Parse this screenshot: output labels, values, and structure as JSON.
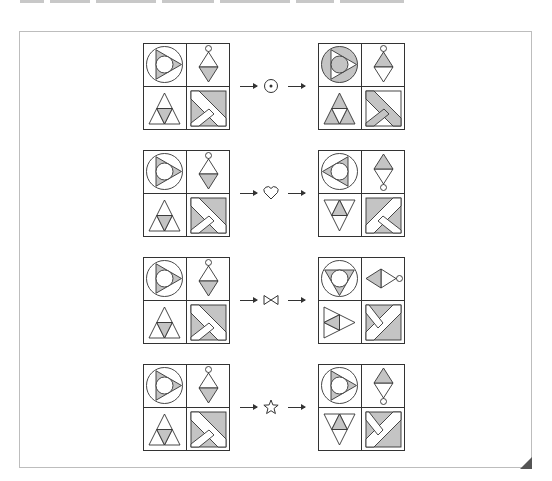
{
  "colors": {
    "stroke": "#333333",
    "shade": "#c4c4c4",
    "background": "#ffffff",
    "frame_border": "#bdbdbd"
  },
  "puzzle": {
    "rows": [
      {
        "operator": {
          "symbol": "⊙",
          "icon": "circled-dot-icon"
        },
        "input": {
          "circle_triangle": {
            "dir": "right",
            "inverted": false
          },
          "diamond": {
            "ring": "top",
            "shaded_half": "far"
          },
          "triangle": {
            "dir": "up",
            "pattern": "center"
          },
          "square": {
            "transform": "none",
            "inverted": false
          }
        },
        "output": {
          "circle_triangle": {
            "dir": "right",
            "inverted": true
          },
          "diamond": {
            "ring": "top",
            "shaded_half": "near"
          },
          "triangle": {
            "dir": "up",
            "pattern": "corners"
          },
          "square": {
            "transform": "none",
            "inverted": true
          }
        }
      },
      {
        "operator": {
          "symbol": "♡",
          "icon": "heart-icon"
        },
        "input": {
          "circle_triangle": {
            "dir": "right",
            "inverted": false
          },
          "diamond": {
            "ring": "top",
            "shaded_half": "far"
          },
          "triangle": {
            "dir": "up",
            "pattern": "center"
          },
          "square": {
            "transform": "none",
            "inverted": false
          }
        },
        "output": {
          "circle_triangle": {
            "dir": "left",
            "inverted": false
          },
          "diamond": {
            "ring": "bottom",
            "shaded_half": "far"
          },
          "triangle": {
            "dir": "down",
            "pattern": "center"
          },
          "square": {
            "transform": "flipx",
            "inverted": false
          }
        }
      },
      {
        "operator": {
          "symbol": "⋈",
          "icon": "bowtie-icon"
        },
        "input": {
          "circle_triangle": {
            "dir": "right",
            "inverted": false
          },
          "diamond": {
            "ring": "top",
            "shaded_half": "far"
          },
          "triangle": {
            "dir": "up",
            "pattern": "center"
          },
          "square": {
            "transform": "none",
            "inverted": false
          }
        },
        "output": {
          "circle_triangle": {
            "dir": "down",
            "inverted": false
          },
          "diamond": {
            "ring": "right",
            "shaded_half": "far"
          },
          "triangle": {
            "dir": "right",
            "pattern": "center"
          },
          "square": {
            "transform": "rot90",
            "inverted": false
          }
        }
      },
      {
        "operator": {
          "symbol": "☆",
          "icon": "star-icon"
        },
        "input": {
          "circle_triangle": {
            "dir": "right",
            "inverted": false
          },
          "diamond": {
            "ring": "top",
            "shaded_half": "far"
          },
          "triangle": {
            "dir": "up",
            "pattern": "center"
          },
          "square": {
            "transform": "none",
            "inverted": false
          }
        },
        "output": {
          "circle_triangle": {
            "dir": "right",
            "inverted": false
          },
          "diamond": {
            "ring": "bottom",
            "shaded_half": "far"
          },
          "triangle": {
            "dir": "down",
            "pattern": "center"
          },
          "square": {
            "transform": "rot90",
            "inverted": false
          }
        }
      }
    ]
  }
}
